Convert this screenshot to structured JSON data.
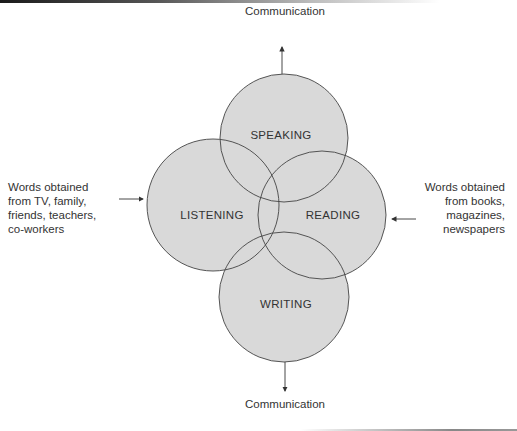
{
  "diagram": {
    "title": "",
    "fill_color": "#d9d9d9",
    "stroke_color": "#444444",
    "circles": [
      {
        "id": "speaking",
        "label": "SPEAKING",
        "cx": 284,
        "cy": 138,
        "r": 64
      },
      {
        "id": "listening",
        "label": "LISTENING",
        "cx": 213,
        "cy": 205,
        "r": 66
      },
      {
        "id": "reading",
        "label": "READING",
        "cx": 322,
        "cy": 215,
        "r": 64
      },
      {
        "id": "writing",
        "label": "WRITING",
        "cx": 284,
        "cy": 297,
        "r": 65
      }
    ],
    "outputs": {
      "top": "Communication",
      "bottom": "Communication"
    },
    "inputs": {
      "left": {
        "lines": [
          "Words obtained",
          "from TV, family,",
          "friends, teachers,",
          "co-workers"
        ]
      },
      "right": {
        "lines": [
          "Words obtained",
          "from books,",
          "magazines,",
          "newspapers"
        ]
      }
    }
  }
}
